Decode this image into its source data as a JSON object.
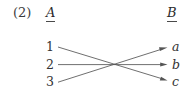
{
  "figure": {
    "item_number": "(2)",
    "headers": {
      "left": "A",
      "right": "B"
    },
    "left_nodes": [
      {
        "label": "1"
      },
      {
        "label": "2"
      },
      {
        "label": "3"
      }
    ],
    "right_nodes": [
      {
        "label": "a"
      },
      {
        "label": "b"
      },
      {
        "label": "c"
      }
    ],
    "mappings": [
      {
        "from": "1",
        "to": "c"
      },
      {
        "from": "2",
        "to": "b"
      },
      {
        "from": "3",
        "to": "a"
      }
    ],
    "colors": {
      "ink": "#2b2b2b",
      "line": "#555555",
      "background": "#ffffff"
    }
  }
}
